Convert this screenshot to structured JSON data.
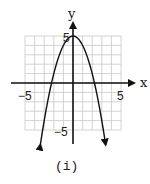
{
  "chart_data": {
    "type": "line",
    "title": "",
    "caption": "(i)",
    "xlabel": "x",
    "ylabel": "y",
    "xlim": [
      -5,
      5
    ],
    "ylim": [
      -5,
      5
    ],
    "grid": true,
    "grid_step": 1,
    "x_tick_labels": [
      "-5",
      "5"
    ],
    "y_tick_labels": [
      "5",
      "-5"
    ],
    "x_tick_labels_display": [
      "−5",
      "5"
    ],
    "y_tick_labels_display": [
      "5",
      "−5"
    ],
    "series": [
      {
        "name": "parabola",
        "equation": "y = -x^2 + 5",
        "vertex": [
          0,
          5
        ],
        "roots": [
          -2.236,
          2.236
        ],
        "x": [
          -3.4,
          -3,
          -2.5,
          -2.236,
          -2,
          -1.5,
          -1,
          -0.5,
          0,
          0.5,
          1,
          1.5,
          2,
          2.236,
          2.5,
          3,
          3.4
        ],
        "values": [
          -6.56,
          -4,
          -1.25,
          0,
          1,
          2.75,
          4,
          4.75,
          5,
          4.75,
          4,
          2.75,
          1,
          0,
          -1.25,
          -4,
          -6.56
        ],
        "arrows_at_ends": true
      }
    ]
  },
  "labels": {
    "x_axis": "x",
    "y_axis": "y",
    "x_min": "−5",
    "x_max": "5",
    "y_max": "5",
    "y_min": "−5",
    "caption": "(i)"
  },
  "colors": {
    "grid": "#c8c8c8",
    "axis": "#111111",
    "curve": "#111111"
  }
}
